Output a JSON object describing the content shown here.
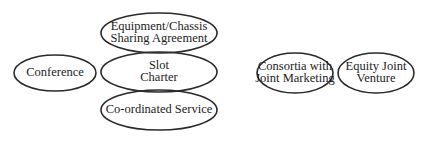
{
  "diagram": {
    "title": "",
    "stroke_color": "#2a2a2a",
    "text_color": "#1c1c1c",
    "background": "#ffffff",
    "nodes": [
      {
        "id": "conference",
        "lines": [
          "Conference"
        ],
        "shape": "ellipse",
        "cx": 55,
        "cy": 73,
        "rx": 41,
        "ry": 18
      },
      {
        "id": "equipment-chassis-sharing",
        "lines": [
          "Equipment/Chassis",
          "Sharing Agreement"
        ],
        "shape": "ellipse",
        "cx": 159,
        "cy": 33,
        "rx": 58,
        "ry": 20
      },
      {
        "id": "slot-charter",
        "lines": [
          "Slot",
          "Charter"
        ],
        "shape": "ellipse",
        "cx": 159,
        "cy": 72,
        "rx": 58,
        "ry": 20
      },
      {
        "id": "coordinated-service",
        "lines": [
          "Co-ordinated Service"
        ],
        "shape": "ellipse",
        "cx": 159,
        "cy": 110,
        "rx": 58,
        "ry": 20
      },
      {
        "id": "consortia-joint-marketing",
        "lines": [
          "Consortia with",
          "Joint Marketing"
        ],
        "shape": "ellipse",
        "cx": 295,
        "cy": 73,
        "rx": 38,
        "ry": 20
      },
      {
        "id": "equity-joint-venture",
        "lines": [
          "Equity Joint",
          "Venture"
        ],
        "shape": "ellipse",
        "cx": 376,
        "cy": 73,
        "rx": 38,
        "ry": 20
      }
    ]
  }
}
